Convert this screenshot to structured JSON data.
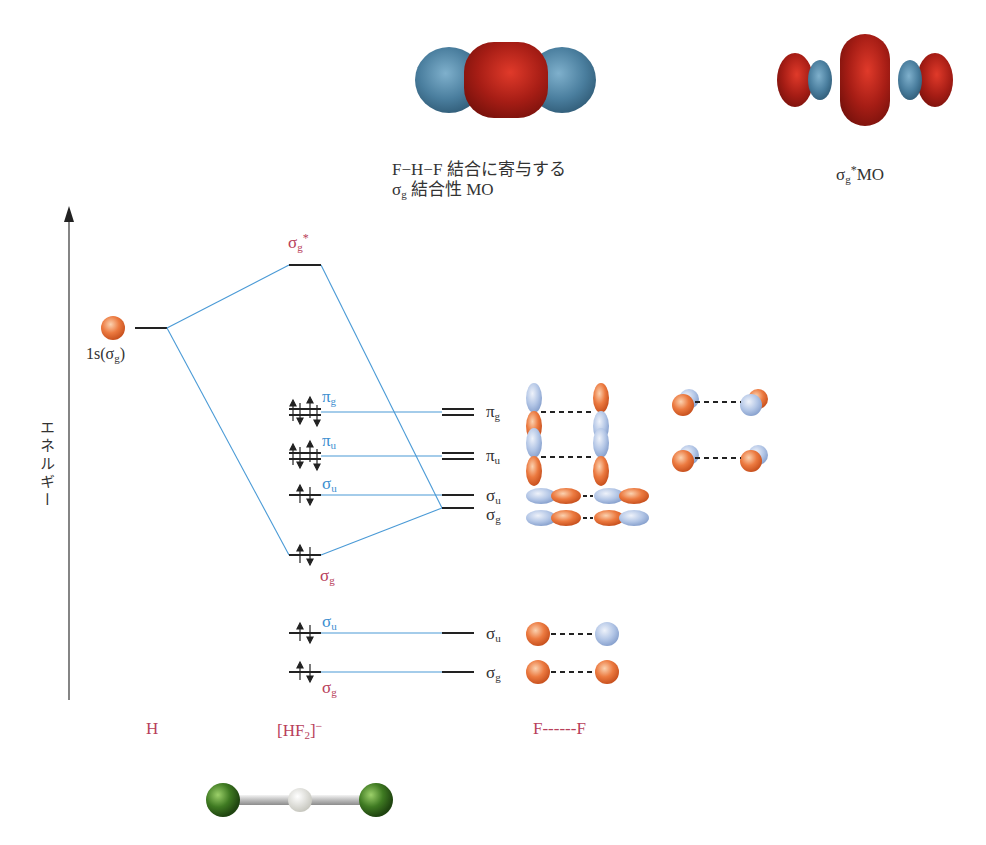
{
  "top_images": {
    "bonding_mo": {
      "caption_line1": "F−H−F 結合に寄与する",
      "caption_line2_sym": "σ",
      "caption_line2_sub": "g",
      "caption_line2_rest": " 結合性 MO"
    },
    "antibonding_mo": {
      "caption_sym": "σ",
      "caption_sub": "g",
      "caption_sup": "*",
      "caption_rest": "MO"
    }
  },
  "axis": {
    "label": "エネルギー"
  },
  "h_atom": {
    "orbital_label": "1s(",
    "orbital_sym": "σ",
    "orbital_sub": "g",
    "orbital_close": ")"
  },
  "hf2_levels": {
    "sigma_g_star": {
      "sym": "σ",
      "sub": "g",
      "sup": "*"
    },
    "pi_g": {
      "sym": "π",
      "sub": "g"
    },
    "pi_u": {
      "sym": "π",
      "sub": "u"
    },
    "sigma_u_mid": {
      "sym": "σ",
      "sub": "u"
    },
    "sigma_g_mid": {
      "sym": "σ",
      "sub": "g"
    },
    "sigma_u_low": {
      "sym": "σ",
      "sub": "u"
    },
    "sigma_g_low": {
      "sym": "σ",
      "sub": "g"
    }
  },
  "ff_levels": [
    {
      "sym": "π",
      "sub": "g"
    },
    {
      "sym": "π",
      "sub": "u"
    },
    {
      "sym": "σ",
      "sub": "u"
    },
    {
      "sym": "σ",
      "sub": "g"
    },
    {
      "sym": "σ",
      "sub": "u"
    },
    {
      "sym": "σ",
      "sub": "g"
    }
  ],
  "bottom_labels": {
    "h": "H",
    "hf2_open": "[HF",
    "hf2_sub": "2",
    "hf2_close": "]",
    "hf2_charge": "−",
    "ff": "F------F"
  },
  "colors": {
    "correlation_line": "#4a9ad6",
    "level_line": "#222222",
    "label_red": "#b8405a",
    "label_blue": "#3d8fd0",
    "orbital_orange": "#e8703a",
    "orbital_blue": "#a9bfe3",
    "mo_red": "#b0201a",
    "mo_blue": "#4d7fa0",
    "fluorine_green": "#3f7a22"
  }
}
